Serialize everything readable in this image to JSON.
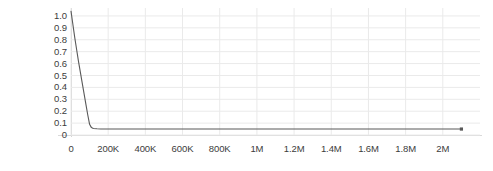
{
  "chart_data": {
    "type": "line",
    "title": "",
    "subtitle": "",
    "xlabel": "",
    "ylabel": "",
    "xlim": [
      0,
      2200000
    ],
    "ylim": [
      0,
      1.05
    ],
    "grid": true,
    "legend": null,
    "x_tick_labels": [
      "0",
      "200K",
      "400K",
      "600K",
      "800K",
      "1M",
      "1.2M",
      "1.4M",
      "1.6M",
      "1.8M",
      "2M"
    ],
    "x_tick_values": [
      0,
      200000,
      400000,
      600000,
      800000,
      1000000,
      1200000,
      1400000,
      1600000,
      1800000,
      2000000
    ],
    "y_tick_labels": [
      "1.0",
      "0.9",
      "0.8",
      "0.7",
      "0.6",
      "0.5",
      "0.4",
      "0.3",
      "0.2",
      "0.1",
      "0"
    ],
    "y_tick_values": [
      1.0,
      0.9,
      0.8,
      0.7,
      0.6,
      0.5,
      0.4,
      0.3,
      0.2,
      0.1,
      0
    ],
    "line_color": "#595959",
    "marker": {
      "shape": "square",
      "x": 2100000,
      "y": 0.05,
      "color": "#595959"
    },
    "series": [
      {
        "name": "decay",
        "x": [
          0,
          10000,
          20000,
          30000,
          40000,
          50000,
          60000,
          70000,
          80000,
          90000,
          100000,
          110000,
          120000,
          140000,
          160000,
          200000,
          300000,
          500000,
          800000,
          1200000,
          1600000,
          2000000,
          2100000
        ],
        "values": [
          1.04,
          0.93,
          0.82,
          0.72,
          0.62,
          0.53,
          0.44,
          0.35,
          0.26,
          0.17,
          0.09,
          0.062,
          0.055,
          0.052,
          0.051,
          0.05,
          0.05,
          0.05,
          0.05,
          0.05,
          0.05,
          0.05,
          0.05
        ]
      }
    ]
  }
}
